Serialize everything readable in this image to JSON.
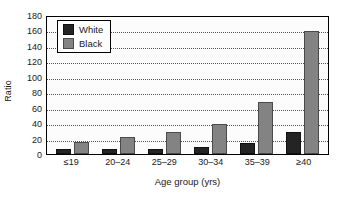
{
  "chart_data": {
    "type": "bar",
    "title": "",
    "xlabel": "Age group (yrs)",
    "ylabel": "Ratio",
    "categories": [
      "≤19",
      "20–24",
      "25–29",
      "30–34",
      "35–39",
      "≥40"
    ],
    "series": [
      {
        "name": "White",
        "color": "#242424",
        "values": [
          6,
          7,
          7,
          9,
          14,
          28
        ]
      },
      {
        "name": "Black",
        "color": "#838383",
        "values": [
          16,
          22,
          29,
          39,
          68,
          159
        ]
      }
    ],
    "ylim": [
      0,
      180
    ],
    "ytick_step": 20,
    "yticks": [
      0,
      20,
      40,
      60,
      80,
      100,
      120,
      140,
      160,
      180
    ],
    "ytick_labels": [
      "0",
      "20",
      "40",
      "60",
      "80",
      "100",
      "120",
      "140",
      "160",
      "180"
    ],
    "grid": true,
    "grid_axis": "y",
    "grid_style": "dotted",
    "legend_position": "top-left",
    "legend_entries": [
      "White",
      "Black"
    ],
    "frame": true
  }
}
